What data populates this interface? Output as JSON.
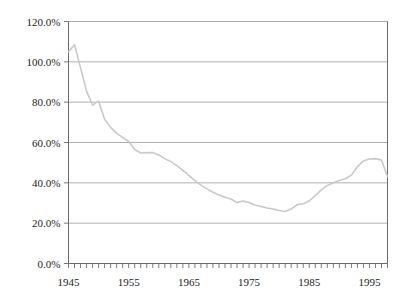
{
  "chart_data": {
    "type": "line",
    "title": "",
    "subtitle": "",
    "xlabel": "",
    "ylabel": "",
    "xlim": [
      1945,
      1998
    ],
    "ylim": [
      0,
      1.2
    ],
    "grid": "horizontal",
    "legend": null,
    "line_color": "#c9c9c9",
    "axis_color": "#6b6b6b",
    "grid_color": "#a8a8a8",
    "y_ticks": [
      0,
      0.2,
      0.4,
      0.6,
      0.8,
      1.0,
      1.2
    ],
    "y_tick_labels": [
      "0.0%",
      "20.0%",
      "40.0%",
      "60.0%",
      "80.0%",
      "100.0%",
      "120.0%"
    ],
    "x_ticks": [
      1945,
      1955,
      1965,
      1975,
      1985,
      1995
    ],
    "x_tick_labels": [
      "1945",
      "1955",
      "1965",
      "1975",
      "1985",
      "1995"
    ],
    "x_minor_tick_step": 1,
    "x": [
      1945,
      1946,
      1947,
      1948,
      1949,
      1950,
      1951,
      1952,
      1953,
      1954,
      1955,
      1956,
      1957,
      1958,
      1959,
      1960,
      1961,
      1962,
      1963,
      1964,
      1965,
      1966,
      1967,
      1968,
      1969,
      1970,
      1971,
      1972,
      1973,
      1974,
      1975,
      1976,
      1977,
      1978,
      1979,
      1980,
      1981,
      1982,
      1983,
      1984,
      1985,
      1986,
      1987,
      1988,
      1989,
      1990,
      1991,
      1992,
      1993,
      1994,
      1995,
      1996,
      1997,
      1998
    ],
    "values": [
      1.05,
      1.085,
      0.97,
      0.855,
      0.785,
      0.805,
      0.715,
      0.675,
      0.645,
      0.625,
      0.605,
      0.565,
      0.548,
      0.55,
      0.55,
      0.538,
      0.52,
      0.505,
      0.485,
      0.462,
      0.437,
      0.411,
      0.389,
      0.37,
      0.353,
      0.34,
      0.328,
      0.32,
      0.302,
      0.31,
      0.302,
      0.29,
      0.283,
      0.275,
      0.27,
      0.263,
      0.258,
      0.27,
      0.292,
      0.296,
      0.31,
      0.337,
      0.365,
      0.387,
      0.4,
      0.412,
      0.42,
      0.438,
      0.48,
      0.508,
      0.518,
      0.52,
      0.513,
      0.43
    ]
  }
}
